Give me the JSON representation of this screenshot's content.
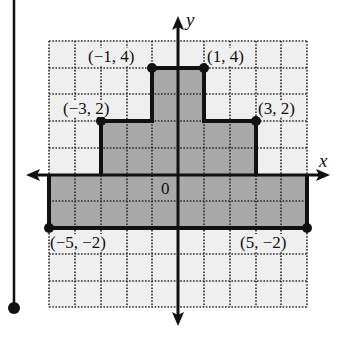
{
  "figure": {
    "axes": {
      "x_label": "x",
      "y_label": "y",
      "origin_label": "0"
    },
    "grid": {
      "x_range": [
        -5,
        5
      ],
      "y_range": [
        -5,
        5
      ],
      "step": 1
    },
    "shape": {
      "fill_color": "#a8a8a8",
      "vertices": [
        [
          -5,
          -2
        ],
        [
          -5,
          0
        ],
        [
          -3,
          0
        ],
        [
          -3,
          2
        ],
        [
          -1,
          2
        ],
        [
          -1,
          4
        ],
        [
          1,
          4
        ],
        [
          1,
          2
        ],
        [
          3,
          2
        ],
        [
          3,
          0
        ],
        [
          5,
          0
        ],
        [
          5,
          -2
        ]
      ]
    },
    "points": [
      {
        "label": "(−1, 4)"
      },
      {
        "label": "(1, 4)"
      },
      {
        "label": "(−3, 2)"
      },
      {
        "label": "(3, 2)"
      },
      {
        "label": "(−5, −2)"
      },
      {
        "label": "(5, −2)"
      }
    ],
    "colors": {
      "grid_bg": "#efefef",
      "grid_line": "#333333",
      "shape": "#a8a8a8",
      "stroke": "#111111"
    }
  }
}
